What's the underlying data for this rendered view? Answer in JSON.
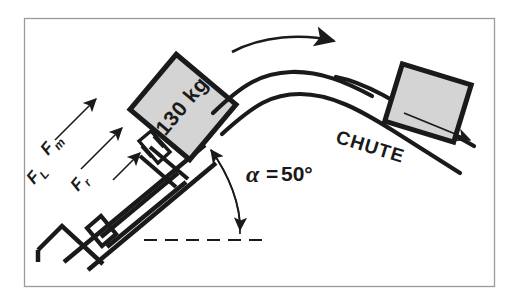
{
  "figure": {
    "background_color": "#ffffff",
    "ink_color": "#1a1a1a",
    "crate_fill_color": "#d4d4d4",
    "border_color": "#9a9a9a"
  },
  "crate_left": {
    "mass_label": "130 kg",
    "rotation_deg": -50,
    "fill": "#d4d4d4"
  },
  "crate_right": {
    "fill": "#d4d4d4",
    "rotation_deg": -17
  },
  "chute": {
    "label": "CHUTE",
    "rotation_deg": 17
  },
  "angle": {
    "symbol": "α",
    "equals": "=",
    "value": "50°",
    "full_label": "α = 50°"
  },
  "forces": [
    {
      "name": "Fₘ",
      "symbol": "F",
      "subscript": "m",
      "rotation_deg": -50
    },
    {
      "name": "Fₗ",
      "symbol": "F",
      "subscript": "L",
      "rotation_deg": -50
    },
    {
      "name": "Fᵣ",
      "symbol": "F",
      "subscript": "r",
      "rotation_deg": -50
    }
  ],
  "annotations": {
    "motion_arrow": "curved-arrow-right",
    "slide_arrow": "straight-arrow-down-right",
    "reference_line": "dashed-horizontal-baseline"
  }
}
